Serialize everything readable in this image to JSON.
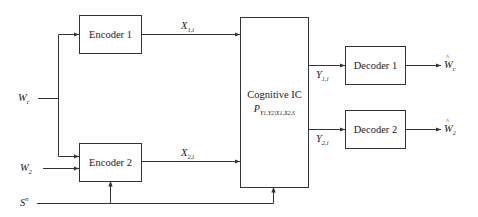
{
  "diagram": {
    "type": "block-diagram",
    "inputs": {
      "common_message": {
        "symbol": "W",
        "subscript": "c",
        "text": "𝒲c"
      },
      "private_message": {
        "symbol": "W",
        "subscript": "2",
        "text": "𝒲2"
      },
      "state": {
        "symbol": "S",
        "superscript": "n",
        "text": "Sⁿ"
      }
    },
    "blocks": {
      "encoder1": {
        "label": "Encoder 1"
      },
      "encoder2": {
        "label": "Encoder 2"
      },
      "channel": {
        "title": "Cognitive IC",
        "distribution": {
          "base": "P",
          "subscript": "Y1,Y2|X1,X2,S"
        }
      },
      "decoder1": {
        "label": "Decoder 1"
      },
      "decoder2": {
        "label": "Decoder 2"
      }
    },
    "signals": {
      "x1": {
        "symbol": "X",
        "subscript": "1,i"
      },
      "x2": {
        "symbol": "X",
        "subscript": "2,i"
      },
      "y1": {
        "symbol": "Y",
        "subscript": "1,i"
      },
      "y2": {
        "symbol": "Y",
        "subscript": "2,i"
      }
    },
    "outputs": {
      "est_common": {
        "symbol": "W",
        "subscript": "c",
        "hat": true
      },
      "est_private": {
        "symbol": "W",
        "subscript": "2",
        "hat": true
      }
    },
    "edges": [
      {
        "from": "Wc",
        "to": "encoder1"
      },
      {
        "from": "Wc",
        "to": "encoder2"
      },
      {
        "from": "W2",
        "to": "encoder2"
      },
      {
        "from": "Sn",
        "to": "encoder2"
      },
      {
        "from": "Sn",
        "to": "channel"
      },
      {
        "from": "encoder1",
        "to": "channel",
        "label": "X1,i"
      },
      {
        "from": "encoder2",
        "to": "channel",
        "label": "X2,i"
      },
      {
        "from": "channel",
        "to": "decoder1",
        "label": "Y1,i"
      },
      {
        "from": "channel",
        "to": "decoder2",
        "label": "Y2,i"
      },
      {
        "from": "decoder1",
        "to": "Ŵc"
      },
      {
        "from": "decoder2",
        "to": "Ŵ2"
      }
    ]
  }
}
